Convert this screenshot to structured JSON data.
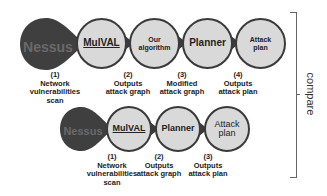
{
  "top_row": {
    "source": {
      "logo_text": "Nessus",
      "step": "(1)",
      "caption": [
        "Network",
        "vulnerabilities",
        "scan"
      ]
    },
    "nodes": [
      {
        "label": "MulVAL",
        "step": "(2)",
        "caption": [
          "Outputs",
          "attack graph"
        ]
      },
      {
        "label": "Our algorithm",
        "label_lines": [
          "Our",
          "algorithm"
        ],
        "step": "(3)",
        "caption": [
          "Modified",
          "attack graph"
        ]
      },
      {
        "label": "Planner",
        "step": "(4)",
        "caption": [
          "Outputs",
          "attack plan"
        ]
      },
      {
        "label": "Attack plan",
        "label_lines": [
          "Attack",
          "plan"
        ]
      }
    ]
  },
  "bottom_row": {
    "source": {
      "logo_text": "Nessus",
      "step": "(1)",
      "caption": [
        "Network",
        "vulnerabilities",
        "scan"
      ]
    },
    "nodes": [
      {
        "label": "MulVAL",
        "step": "(2)",
        "caption": [
          "Outputs",
          "attack graph"
        ]
      },
      {
        "label": "Planner",
        "step": "(3)",
        "caption": [
          "Outputs",
          "attack plan"
        ]
      },
      {
        "label": "Attack plan",
        "label_lines": [
          "Attack",
          "plan"
        ]
      }
    ]
  },
  "bracket": {
    "label": "compare"
  },
  "colors": {
    "node_fill": "#d9d9d9",
    "node_border": "#3a3a3a",
    "nessus_fill": "#3f3f3f"
  }
}
